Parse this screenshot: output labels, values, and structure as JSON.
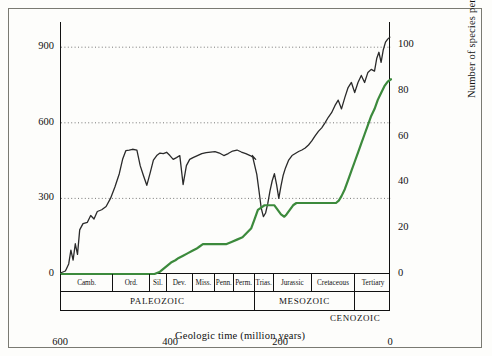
{
  "chart_data": {
    "type": "line",
    "title": "",
    "xlabel": "Geologic time (million years)",
    "ylabel_left": "Number of families",
    "ylabel_right": "Number of species per flora",
    "xlim": [
      600,
      0
    ],
    "xticks": [
      600,
      400,
      200,
      0
    ],
    "ylim_left": [
      0,
      1000
    ],
    "yticks_left": [
      0,
      300,
      600,
      900
    ],
    "ylim_right": [
      0,
      110
    ],
    "yticks_right": [
      0,
      20,
      40,
      60,
      80,
      100
    ],
    "grid": "horizontal-dotted",
    "series": [
      {
        "name": "Number of families",
        "axis": "left",
        "color": "#2a2a2a",
        "points": [
          [
            600,
            5
          ],
          [
            592,
            12
          ],
          [
            586,
            40
          ],
          [
            582,
            95
          ],
          [
            578,
            55
          ],
          [
            574,
            120
          ],
          [
            570,
            78
          ],
          [
            566,
            175
          ],
          [
            560,
            200
          ],
          [
            552,
            205
          ],
          [
            546,
            232
          ],
          [
            540,
            218
          ],
          [
            534,
            248
          ],
          [
            526,
            255
          ],
          [
            518,
            268
          ],
          [
            510,
            300
          ],
          [
            502,
            345
          ],
          [
            494,
            398
          ],
          [
            488,
            455
          ],
          [
            482,
            490
          ],
          [
            476,
            492
          ],
          [
            470,
            495
          ],
          [
            462,
            492
          ],
          [
            456,
            430
          ],
          [
            450,
            390
          ],
          [
            444,
            352
          ],
          [
            438,
            400
          ],
          [
            432,
            452
          ],
          [
            426,
            470
          ],
          [
            420,
            480
          ],
          [
            414,
            478
          ],
          [
            408,
            483
          ],
          [
            402,
            470
          ],
          [
            396,
            455
          ],
          [
            390,
            462
          ],
          [
            384,
            470
          ],
          [
            378,
            355
          ],
          [
            372,
            430
          ],
          [
            366,
            455
          ],
          [
            360,
            462
          ],
          [
            352,
            470
          ],
          [
            344,
            478
          ],
          [
            336,
            482
          ],
          [
            328,
            484
          ],
          [
            320,
            486
          ],
          [
            312,
            480
          ],
          [
            304,
            470
          ],
          [
            296,
            478
          ],
          [
            288,
            488
          ],
          [
            280,
            492
          ],
          [
            272,
            484
          ],
          [
            264,
            478
          ],
          [
            256,
            470
          ],
          [
            250,
            462
          ],
          [
            246,
            455
          ],
          [
            252,
            470
          ],
          [
            244,
            395
          ],
          [
            240,
            330
          ],
          [
            236,
            262
          ],
          [
            232,
            228
          ],
          [
            228,
            242
          ],
          [
            224,
            280
          ],
          [
            220,
            330
          ],
          [
            216,
            370
          ],
          [
            212,
            398
          ],
          [
            208,
            355
          ],
          [
            204,
            300
          ],
          [
            200,
            350
          ],
          [
            196,
            392
          ],
          [
            192,
            420
          ],
          [
            186,
            452
          ],
          [
            180,
            470
          ],
          [
            174,
            478
          ],
          [
            168,
            486
          ],
          [
            162,
            492
          ],
          [
            156,
            500
          ],
          [
            150,
            512
          ],
          [
            144,
            528
          ],
          [
            138,
            548
          ],
          [
            132,
            566
          ],
          [
            126,
            580
          ],
          [
            120,
            600
          ],
          [
            114,
            622
          ],
          [
            108,
            640
          ],
          [
            102,
            668
          ],
          [
            96,
            690
          ],
          [
            90,
            655
          ],
          [
            84,
            700
          ],
          [
            78,
            740
          ],
          [
            72,
            760
          ],
          [
            66,
            720
          ],
          [
            60,
            760
          ],
          [
            54,
            788
          ],
          [
            48,
            760
          ],
          [
            42,
            800
          ],
          [
            36,
            812
          ],
          [
            30,
            805
          ],
          [
            26,
            855
          ],
          [
            22,
            880
          ],
          [
            18,
            840
          ],
          [
            14,
            890
          ],
          [
            10,
            920
          ],
          [
            6,
            932
          ],
          [
            2,
            940
          ]
        ]
      },
      {
        "name": "Number of species per flora",
        "axis": "right",
        "color": "#3c8a3c",
        "points": [
          [
            600,
            0
          ],
          [
            430,
            0
          ],
          [
            420,
            1
          ],
          [
            410,
            3
          ],
          [
            400,
            5
          ],
          [
            392,
            6
          ],
          [
            386,
            7
          ],
          [
            378,
            8
          ],
          [
            370,
            9
          ],
          [
            362,
            10
          ],
          [
            354,
            11
          ],
          [
            348,
            12
          ],
          [
            342,
            13
          ],
          [
            336,
            13
          ],
          [
            330,
            13
          ],
          [
            320,
            13
          ],
          [
            310,
            13
          ],
          [
            300,
            13
          ],
          [
            290,
            14
          ],
          [
            280,
            15
          ],
          [
            270,
            16
          ],
          [
            262,
            18
          ],
          [
            254,
            20
          ],
          [
            248,
            24
          ],
          [
            242,
            28
          ],
          [
            236,
            29
          ],
          [
            230,
            30
          ],
          [
            224,
            30
          ],
          [
            218,
            30
          ],
          [
            212,
            30
          ],
          [
            206,
            28
          ],
          [
            200,
            26
          ],
          [
            194,
            25
          ],
          [
            190,
            26
          ],
          [
            184,
            28
          ],
          [
            178,
            30
          ],
          [
            172,
            31
          ],
          [
            166,
            31
          ],
          [
            160,
            31
          ],
          [
            150,
            31
          ],
          [
            140,
            31
          ],
          [
            130,
            31
          ],
          [
            120,
            31
          ],
          [
            110,
            31
          ],
          [
            100,
            31
          ],
          [
            95,
            32
          ],
          [
            90,
            34
          ],
          [
            84,
            37
          ],
          [
            78,
            41
          ],
          [
            72,
            45
          ],
          [
            66,
            49
          ],
          [
            60,
            53
          ],
          [
            54,
            57
          ],
          [
            48,
            61
          ],
          [
            42,
            65
          ],
          [
            36,
            69
          ],
          [
            30,
            72
          ],
          [
            24,
            76
          ],
          [
            18,
            79
          ],
          [
            12,
            82
          ],
          [
            6,
            84
          ],
          [
            0,
            85
          ]
        ]
      }
    ],
    "geologic_periods": [
      {
        "label": "Camb.",
        "start": 600,
        "end": 505
      },
      {
        "label": "Ord.",
        "start": 505,
        "end": 438
      },
      {
        "label": "Sil.",
        "start": 438,
        "end": 408
      },
      {
        "label": "Dev.",
        "start": 408,
        "end": 360
      },
      {
        "label": "Miss.",
        "start": 360,
        "end": 320
      },
      {
        "label": "Penn.",
        "start": 320,
        "end": 286
      },
      {
        "label": "Perm.",
        "start": 286,
        "end": 248
      },
      {
        "label": "Trias.",
        "start": 248,
        "end": 213
      },
      {
        "label": "Jurassic",
        "start": 213,
        "end": 144
      },
      {
        "label": "Cretaceous",
        "start": 144,
        "end": 65
      },
      {
        "label": "Tertiary",
        "start": 65,
        "end": 0
      }
    ],
    "geologic_eras": [
      {
        "label": "PALEOZOIC",
        "start": 600,
        "end": 248
      },
      {
        "label": "MESOZOIC",
        "start": 248,
        "end": 65
      },
      {
        "label": "",
        "start": 65,
        "end": 0
      }
    ],
    "era_outside_label": "CENOZOIC"
  },
  "axes": {
    "left_ticks": [
      "900",
      "600",
      "300",
      "0"
    ],
    "right_ticks": [
      "100",
      "80",
      "60",
      "40",
      "20",
      "0"
    ],
    "x_ticks": [
      "600",
      "400",
      "200",
      "0"
    ],
    "left_title": "Number of families",
    "right_title": "Number of species per flora",
    "x_title": "Geologic time (million years)"
  }
}
